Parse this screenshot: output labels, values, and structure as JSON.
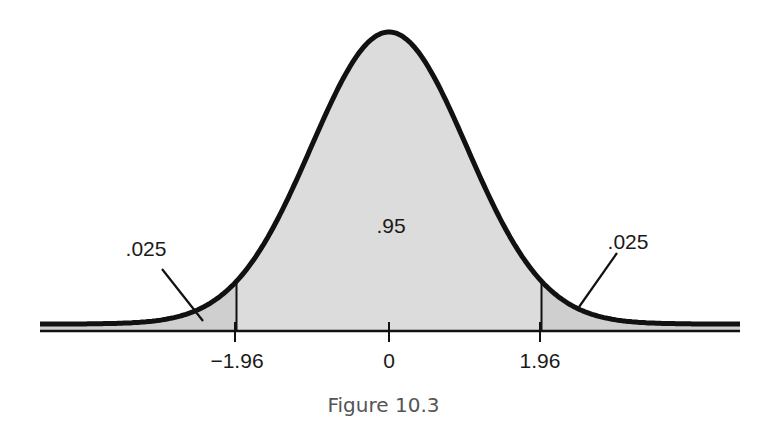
{
  "figure": {
    "caption": "Figure 10.3"
  },
  "colors": {
    "fill": "#dcdcdc",
    "tail_fill": "#cfcfcf",
    "curve": "#111111",
    "axis": "#111111"
  },
  "chart_data": {
    "type": "area",
    "title": "",
    "caption": "Figure 10.3",
    "xlabel": "",
    "ylabel": "",
    "x_ticks": [
      "−1.96",
      "0",
      "1.96"
    ],
    "x_tick_values": [
      -1.96,
      0,
      1.96
    ],
    "xlim": [
      -3.6,
      3.6
    ],
    "regions": [
      {
        "name": "left-tail",
        "range": [
          -3.6,
          -1.96
        ],
        "label": ".025",
        "value": 0.025
      },
      {
        "name": "center",
        "range": [
          -1.96,
          1.96
        ],
        "label": ".95",
        "value": 0.95
      },
      {
        "name": "right-tail",
        "range": [
          1.96,
          3.6
        ],
        "label": ".025",
        "value": 0.025
      }
    ],
    "grid": false,
    "legend": null
  },
  "labels": {
    "left_tail": ".025",
    "center": ".95",
    "right_tail": ".025",
    "tick_left": "−1.96",
    "tick_center": "0",
    "tick_right": "1.96"
  }
}
